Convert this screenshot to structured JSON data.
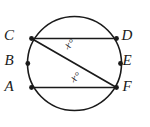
{
  "figure": {
    "background_color": "#ffffff",
    "stroke_color": "#1a1a1a",
    "width": 150,
    "height": 127
  },
  "circle": {
    "name": "circle-outline",
    "center_x": 74.5,
    "center_y": 63.5,
    "radius": 47,
    "stroke_width": 1.6,
    "fill": "none"
  },
  "points": [
    {
      "id": "C",
      "label": "C",
      "cx": 31.5,
      "cy": 38.5,
      "label_x": 9,
      "label_y": 37
    },
    {
      "id": "B",
      "label": "B",
      "cx": 27.8,
      "cy": 63.5,
      "label_x": 9,
      "label_y": 62
    },
    {
      "id": "A",
      "label": "A",
      "cx": 31.5,
      "cy": 87.5,
      "label_x": 9,
      "label_y": 88
    },
    {
      "id": "D",
      "label": "D",
      "cx": 116.5,
      "cy": 38.5,
      "label_x": 127,
      "label_y": 37
    },
    {
      "id": "E",
      "label": "E",
      "cx": 120.5,
      "cy": 63.5,
      "label_x": 127,
      "label_y": 62
    },
    {
      "id": "F",
      "label": "F",
      "cx": 116.5,
      "cy": 87.5,
      "label_x": 127,
      "label_y": 88
    }
  ],
  "chords": [
    {
      "id": "CD",
      "name": "chord-c-d",
      "x1": 31.5,
      "y1": 38.5,
      "x2": 116.5,
      "y2": 38.5,
      "stroke_width": 1.7
    },
    {
      "id": "AF",
      "name": "chord-a-f",
      "x1": 31.5,
      "y1": 87.5,
      "x2": 116.5,
      "y2": 87.5,
      "stroke_width": 1.7
    },
    {
      "id": "CF",
      "name": "chord-c-f",
      "x1": 31.5,
      "y1": 38.5,
      "x2": 116.5,
      "y2": 87.5,
      "stroke_width": 1.7
    }
  ],
  "angle_labels": [
    {
      "id": "angle-upper",
      "text": "x°",
      "x": 70,
      "y": 45,
      "rotation": -30
    },
    {
      "id": "angle-lower",
      "text": "x°",
      "x": 76,
      "y": 78,
      "rotation": -30
    }
  ],
  "point_marker": {
    "radius": 2.4,
    "fill": "#1a1a1a"
  }
}
